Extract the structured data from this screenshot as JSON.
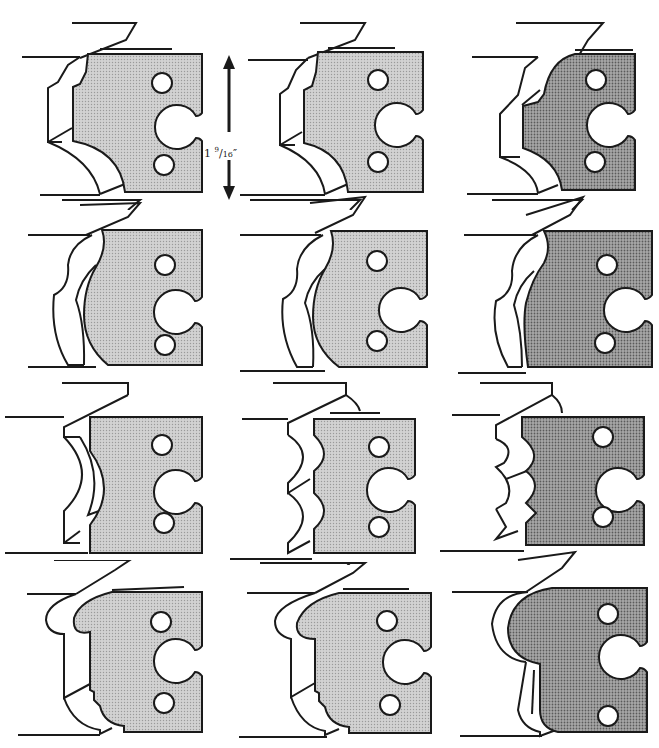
{
  "figure": {
    "title": "",
    "dimension": {
      "whole": "1",
      "num": "9",
      "den": "16",
      "unit": "″",
      "text": "1 9/16″"
    },
    "colors": {
      "ink": "#1a1a1a",
      "fill_light": "#c9c9c9",
      "fill_mid": "#b4b4b4",
      "fill_dark": "#8f8f8f",
      "paper": "#ffffff"
    },
    "profiles": [
      {
        "row": 1,
        "col": 1,
        "type": "cove-chamfer",
        "shade": "light"
      },
      {
        "row": 1,
        "col": 2,
        "type": "cove-chamfer",
        "shade": "light"
      },
      {
        "row": 1,
        "col": 3,
        "type": "cove-chamfer",
        "shade": "dark"
      },
      {
        "row": 2,
        "col": 1,
        "type": "ogee",
        "shade": "light"
      },
      {
        "row": 2,
        "col": 2,
        "type": "ogee",
        "shade": "light"
      },
      {
        "row": 2,
        "col": 3,
        "type": "ogee",
        "shade": "dark"
      },
      {
        "row": 3,
        "col": 1,
        "type": "single-cove",
        "shade": "light"
      },
      {
        "row": 3,
        "col": 2,
        "type": "double-cove",
        "shade": "light"
      },
      {
        "row": 3,
        "col": 3,
        "type": "stepped-cove",
        "shade": "dark"
      },
      {
        "row": 4,
        "col": 1,
        "type": "bead-step",
        "shade": "light"
      },
      {
        "row": 4,
        "col": 2,
        "type": "bead-step",
        "shade": "light"
      },
      {
        "row": 4,
        "col": 3,
        "type": "bead-round",
        "shade": "dark"
      }
    ]
  }
}
